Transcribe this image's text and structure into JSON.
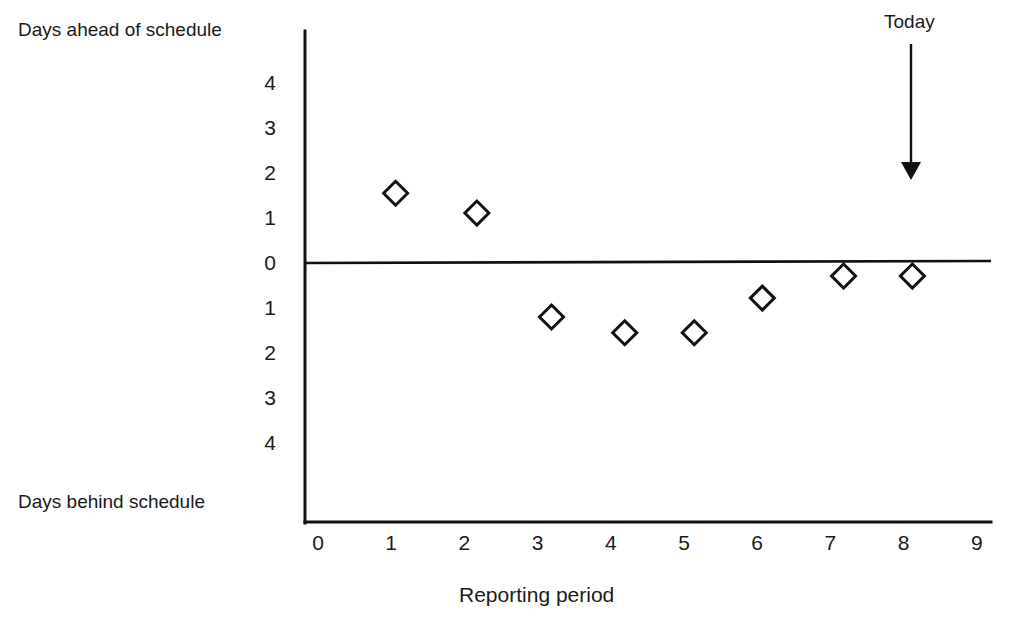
{
  "chart_data": {
    "type": "scatter",
    "title": "",
    "xlabel": "Reporting period",
    "ylabel": "",
    "ylabel_top": "Days ahead of schedule",
    "ylabel_bottom": "Days behind schedule",
    "xlim": [
      0,
      9
    ],
    "ylim": [
      -4.6,
      4.6
    ],
    "grid": false,
    "legend": "none",
    "x_ticks": [
      "0",
      "1",
      "2",
      "3",
      "4",
      "5",
      "6",
      "7",
      "8",
      "9"
    ],
    "x_tick_values": [
      0,
      1,
      2,
      3,
      4,
      5,
      6,
      7,
      8,
      9
    ],
    "y_ticks": [
      "4",
      "3",
      "2",
      "1",
      "0",
      "1",
      "2",
      "3",
      "4"
    ],
    "y_tick_values": [
      4,
      3,
      2,
      1,
      0,
      -1,
      -2,
      -3,
      -4
    ],
    "marker_style": "open-diamond",
    "marker_color": "#111111",
    "series": [
      {
        "name": "Schedule variance",
        "points": [
          {
            "x": 1.06,
            "y": 1.55
          },
          {
            "x": 2.17,
            "y": 1.11
          },
          {
            "x": 3.19,
            "y": -1.2
          },
          {
            "x": 4.19,
            "y": -1.55
          },
          {
            "x": 5.14,
            "y": -1.55
          },
          {
            "x": 6.07,
            "y": -0.78
          },
          {
            "x": 7.18,
            "y": -0.29
          },
          {
            "x": 8.12,
            "y": -0.29
          }
        ]
      }
    ],
    "annotations": [
      {
        "label": "Today",
        "x": 8.1,
        "kind": "down-arrow"
      }
    ],
    "reference_lines": [
      {
        "value": 0,
        "orientation": "horizontal"
      }
    ]
  },
  "labels": {
    "days_ahead": "Days ahead of schedule",
    "days_behind": "Days behind schedule",
    "x_axis_title": "Reporting period",
    "today": "Today"
  },
  "colors": {
    "ink": "#111111",
    "background": "#ffffff"
  }
}
